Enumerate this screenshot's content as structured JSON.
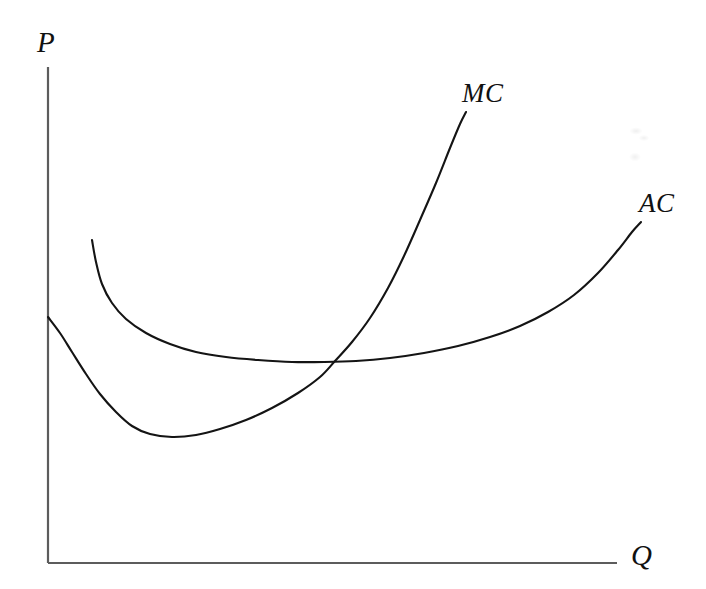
{
  "chart_data": {
    "type": "line",
    "title": "",
    "subtitle": "",
    "xlabel": "Q",
    "ylabel": "P",
    "grid": false,
    "legend": "inline-curve-labels",
    "axis_ranges": {
      "x": [
        0,
        1
      ],
      "y": [
        0,
        1
      ]
    },
    "annotations": [
      {
        "name": "MC",
        "text": "MC",
        "x_px": 462,
        "y_px": 80
      },
      {
        "name": "AC",
        "text": "AC",
        "x_px": 639,
        "y_px": 190
      }
    ],
    "series": [
      {
        "name": "MC",
        "label": "MC",
        "description": "Marginal cost: falls from the vertical axis to a minimum then rises steeply",
        "color": "#141414",
        "points_px": [
          [
            48,
            317
          ],
          [
            60,
            333
          ],
          [
            72,
            352
          ],
          [
            86,
            374
          ],
          [
            100,
            394
          ],
          [
            116,
            412
          ],
          [
            132,
            426
          ],
          [
            150,
            434
          ],
          [
            172,
            437
          ],
          [
            196,
            435
          ],
          [
            220,
            429
          ],
          [
            246,
            420
          ],
          [
            272,
            408
          ],
          [
            298,
            393
          ],
          [
            320,
            377
          ],
          [
            335,
            361
          ],
          [
            352,
            342
          ],
          [
            370,
            318
          ],
          [
            388,
            288
          ],
          [
            404,
            256
          ],
          [
            420,
            220
          ],
          [
            436,
            183
          ],
          [
            450,
            148
          ],
          [
            460,
            124
          ],
          [
            466,
            112
          ]
        ],
        "path": "M48,317 C62,338 82,372 104,398 C126,424 146,434 170,437 C200,440 240,424 276,404 C308,386 326,372 340,354 C362,326 384,288 404,254 C424,218 448,156 466,112"
      },
      {
        "name": "AC",
        "label": "AC",
        "description": "Average cost: falls steeply from a high start, flattens through a shallow minimum, then rises to the right",
        "color": "#141414",
        "points_px": [
          [
            92,
            240
          ],
          [
            96,
            262
          ],
          [
            102,
            284
          ],
          [
            112,
            303
          ],
          [
            126,
            319
          ],
          [
            146,
            333
          ],
          [
            170,
            344
          ],
          [
            196,
            352
          ],
          [
            226,
            357
          ],
          [
            258,
            360
          ],
          [
            292,
            362
          ],
          [
            324,
            362
          ],
          [
            356,
            361
          ],
          [
            390,
            358
          ],
          [
            424,
            353
          ],
          [
            458,
            346
          ],
          [
            490,
            337
          ],
          [
            520,
            326
          ],
          [
            548,
            312
          ],
          [
            574,
            295
          ],
          [
            598,
            273
          ],
          [
            618,
            250
          ],
          [
            632,
            232
          ],
          [
            641,
            222
          ]
        ],
        "path": "M92,240 C94,272 104,300 128,320 C156,343 200,353 250,359 C292,363 330,363 372,360 C430,355 480,341 522,324 C566,306 600,272 620,246 C630,233 637,226 641,222"
      }
    ],
    "intersection": {
      "label": "MC crosses AC near AC minimum",
      "x_px": 335,
      "y_px": 361
    }
  },
  "axes": {
    "y_axis": {
      "name": "price-axis",
      "label": "P",
      "x_px": 48,
      "top_px": 67,
      "bottom_px": 563
    },
    "x_axis": {
      "name": "quantity-axis",
      "label": "Q",
      "y_px": 563,
      "left_px": 48,
      "right_px": 617
    }
  },
  "style": {
    "background": "#ffffff",
    "axis_color": "#5c5c5c",
    "curve_color": "#141414",
    "label_color": "#111111"
  }
}
